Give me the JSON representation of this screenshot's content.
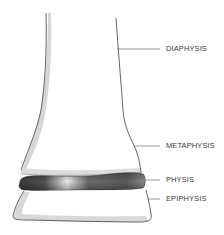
{
  "diagram": {
    "labels": [
      {
        "id": "diaphysis",
        "text": "DIAPHYSIS"
      },
      {
        "id": "metaphysis",
        "text": "METAPHYSIS"
      },
      {
        "id": "physis",
        "text": "PHYSIS"
      },
      {
        "id": "epiphysis",
        "text": "EPIPHYSIS"
      }
    ]
  },
  "colors": {
    "outline": "#3c3c3c",
    "shadow": "#d6d6d6",
    "physis_dark": "#444444",
    "physis_highlight": "#f0f0f0",
    "leader": "#555555",
    "text": "#3a3a3a"
  }
}
